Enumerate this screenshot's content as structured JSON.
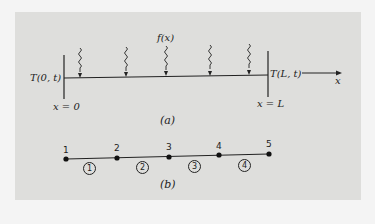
{
  "figure_a": {
    "source_label": "f(x)",
    "left_boundary": "T(0, t)",
    "right_boundary": "T(L, t)",
    "left_position": "x = 0",
    "right_position": "x = L",
    "axis_label": "x",
    "caption": "(a)",
    "heat_source_arrows": 5
  },
  "figure_b": {
    "caption": "(b)",
    "nodes": [
      "1",
      "2",
      "3",
      "4",
      "5"
    ],
    "elements": [
      "1",
      "2",
      "3",
      "4"
    ]
  },
  "colors": {
    "panel_bg": "#dededc",
    "page_bg": "#f4f4f4",
    "ink": "#222222"
  }
}
